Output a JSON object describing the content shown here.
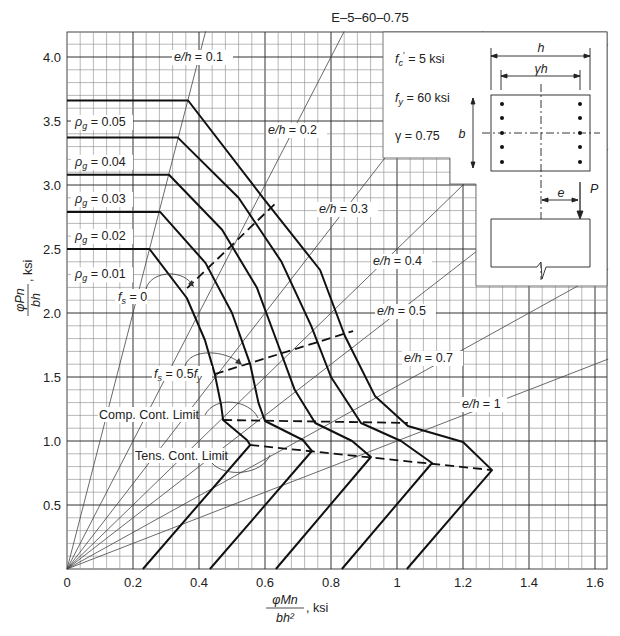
{
  "chart_data": {
    "type": "line",
    "title": "E–5–60–0.75",
    "xlabel": "φMn / bh², ksi",
    "ylabel": "φPn / bh, ksi",
    "xlim": [
      0,
      1.64
    ],
    "ylim": [
      0,
      4.2
    ],
    "grid": true,
    "x_ticks": [
      "0",
      "0.2",
      "0.4",
      "0.6",
      "0.8",
      "1",
      "1.2",
      "1.4",
      "1.6"
    ],
    "y_ticks": [
      "0.5",
      "1.0",
      "1.5",
      "2.0",
      "2.5",
      "3.0",
      "3.5",
      "4.0"
    ],
    "x_tick_values": [
      0,
      0.2,
      0.4,
      0.6,
      0.8,
      1.0,
      1.2,
      1.4,
      1.6
    ],
    "y_tick_values": [
      0.5,
      1.0,
      1.5,
      2.0,
      2.5,
      3.0,
      3.5,
      4.0
    ],
    "series": [
      {
        "name": "ρg = 0.01",
        "points": [
          [
            0,
            2.5
          ],
          [
            0.25,
            2.5
          ],
          [
            0.363,
            2.117
          ],
          [
            0.418,
            1.789
          ],
          [
            0.448,
            1.523
          ],
          [
            0.467,
            1.281
          ],
          [
            0.473,
            1.164
          ],
          [
            0.545,
            1.008
          ],
          [
            0.555,
            0.969
          ],
          [
            0.23,
            0
          ]
        ]
      },
      {
        "name": "ρg = 0.02",
        "points": [
          [
            0,
            2.79
          ],
          [
            0.282,
            2.79
          ],
          [
            0.42,
            2.39
          ],
          [
            0.5,
            2.0
          ],
          [
            0.555,
            1.6
          ],
          [
            0.58,
            1.3
          ],
          [
            0.6,
            1.156
          ],
          [
            0.715,
            1.008
          ],
          [
            0.742,
            0.922
          ],
          [
            0.433,
            0
          ]
        ]
      },
      {
        "name": "ρg = 0.03",
        "points": [
          [
            0,
            3.08
          ],
          [
            0.309,
            3.08
          ],
          [
            0.47,
            2.65
          ],
          [
            0.575,
            2.2
          ],
          [
            0.64,
            1.75
          ],
          [
            0.69,
            1.4
          ],
          [
            0.752,
            1.141
          ],
          [
            0.864,
            1.0
          ],
          [
            0.921,
            0.875
          ],
          [
            0.633,
            0
          ]
        ]
      },
      {
        "name": "ρg = 0.04",
        "points": [
          [
            0,
            3.37
          ],
          [
            0.336,
            3.37
          ],
          [
            0.52,
            2.9
          ],
          [
            0.65,
            2.4
          ],
          [
            0.74,
            1.9
          ],
          [
            0.8,
            1.5
          ],
          [
            0.891,
            1.141
          ],
          [
            1.012,
            1.0
          ],
          [
            1.106,
            0.828
          ],
          [
            0.833,
            0
          ]
        ]
      },
      {
        "name": "ρg = 0.05",
        "points": [
          [
            0,
            3.66
          ],
          [
            0.367,
            3.66
          ],
          [
            0.6,
            2.88
          ],
          [
            0.767,
            2.336
          ],
          [
            0.842,
            1.82
          ],
          [
            0.933,
            1.352
          ],
          [
            1.033,
            1.117
          ],
          [
            1.2,
            0.992
          ],
          [
            1.288,
            0.773
          ],
          [
            1.03,
            0
          ]
        ]
      }
    ],
    "eccentricity_lines": [
      {
        "label": "e/h = 0.1",
        "value": 0.1
      },
      {
        "label": "e/h = 0.2",
        "value": 0.2
      },
      {
        "label": "e/h = 0.3",
        "value": 0.3
      },
      {
        "label": "e/h = 0.4",
        "value": 0.4
      },
      {
        "label": "e/h = 0.5",
        "value": 0.5
      },
      {
        "label": "e/h = 0.7",
        "value": 0.7
      },
      {
        "label": "e/h = 1",
        "value": 1.0
      }
    ],
    "dashed_lines": [
      {
        "name": "fs = 0",
        "points": [
          [
            0.364,
            2.195
          ],
          [
            0.63,
            2.852
          ]
        ]
      },
      {
        "name": "fs = 0.5fy",
        "points": [
          [
            0.448,
            1.523
          ],
          [
            0.867,
            1.859
          ]
        ]
      },
      {
        "name": "Comp. Cont. Limit",
        "points": [
          [
            0.473,
            1.164
          ],
          [
            1.033,
            1.141
          ]
        ]
      },
      {
        "name": "Tens. Cont. Limit",
        "points": [
          [
            0.555,
            0.969
          ],
          [
            1.288,
            0.773
          ]
        ]
      }
    ],
    "annotations": [
      "f′c = 5 ksi",
      "fy = 60 ksi",
      "γ = 0.75"
    ]
  },
  "labels": {
    "title": "E–5–60–0.75",
    "xlabel_num": "φMn",
    "xlabel_den": "bh²",
    "xlabel_unit": ", ksi",
    "ylabel_num": "φPn",
    "ylabel_den": "bh",
    "ylabel_unit": ", ksi",
    "fc": "= 5 ksi",
    "fy": "= 60 ksi",
    "gamma": "γ = 0.75",
    "fs0": "= 0",
    "fs05": "= 0.5",
    "comp": "Comp. Cont. Limit",
    "tens": "Tens. Cont. Limit",
    "rho": [
      "= 0.01",
      "= 0.02",
      "= 0.03",
      "= 0.04",
      "= 0.05"
    ],
    "eh": [
      "= 0.1",
      "= 0.2",
      "= 0.3",
      "= 0.4",
      "= 0.5",
      "= 0.7",
      "= 1"
    ],
    "dim_h": "h",
    "dim_gh": "γh",
    "dim_b": "b",
    "dim_e": "e",
    "load_P": "P"
  }
}
